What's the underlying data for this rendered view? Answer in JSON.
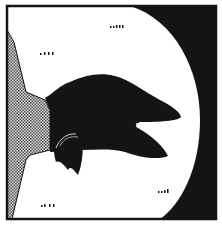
{
  "panel": {
    "description": "Single comic panel: black crow head silhouette with open beak, stippled figure at left, spotlight circle on dark background",
    "colors": {
      "ink": "#141414",
      "paper": "#ffffff",
      "stipple_light": "#d8d8d8",
      "stipple_dark": "#555555"
    },
    "star_marks": [
      {
        "x": 110,
        "y": 26,
        "count": 5
      },
      {
        "x": 40,
        "y": 53,
        "count": 4
      },
      {
        "x": 158,
        "y": 190,
        "count": 4
      },
      {
        "x": 41,
        "y": 205,
        "count": 4
      }
    ]
  }
}
